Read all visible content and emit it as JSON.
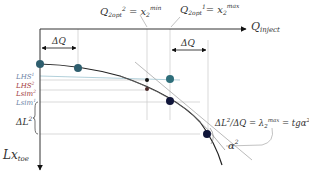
{
  "axes": {
    "x_label": "Q",
    "x_label_sub": "inject",
    "y_label": "Lx",
    "y_label_sub": "toe"
  },
  "annotations": {
    "q_opt_2": {
      "Q": "Q",
      "sub": "2opt",
      "sup": "2",
      "eq": " = x",
      "xsub": "2",
      "xsup": "min"
    },
    "q_opt_1": {
      "Q": "Q",
      "sub": "2opt",
      "sup": "1",
      "eq": "= x",
      "xsub": "2",
      "xsup": "max"
    },
    "delta_q_left": "ΔQ",
    "delta_q_right": "ΔQ",
    "delta_l2": "ΔL",
    "delta_l2_sup": "2",
    "slope_formula": {
      "lhs": "ΔL",
      "lhs_sup": "2",
      "mid": "/ΔQ = λ",
      "lam_sub": "2",
      "lam_sup": "max",
      "rhs": " = tgα",
      "rhs_sup": "2"
    },
    "alpha": "α",
    "alpha_sup": "2"
  },
  "levels": [
    {
      "label": "LHS",
      "sup": "1",
      "color": "#6a7fa5"
    },
    {
      "label": "LHS",
      "sup": "2",
      "color": "#a0383a"
    },
    {
      "label": "Lsim",
      "sup": "2",
      "color": "#a0383a"
    },
    {
      "label": "Lsim",
      "sup": "1",
      "color": "#6a7fa5"
    }
  ],
  "colors": {
    "teal_point": "#2e5e6e",
    "dark_point": "#10163a",
    "axis": "#333333",
    "guide": "#c8c8c8",
    "tangent_blue": "#8fb6c4"
  }
}
